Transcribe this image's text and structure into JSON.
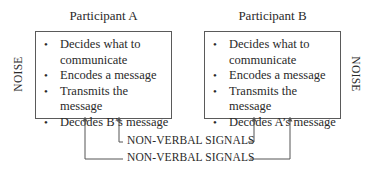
{
  "diagram": {
    "participant_a": {
      "title": "Participant A",
      "items": [
        {
          "line1": "Decides what to",
          "line2": "communicate"
        },
        {
          "line1": "Encodes a message"
        },
        {
          "line1": "Transmits the message"
        },
        {
          "line1": "Decodes B’s message"
        }
      ]
    },
    "participant_b": {
      "title": "Participant B",
      "items": [
        {
          "line1": "Decides what to",
          "line2": "communicate"
        },
        {
          "line1": "Encodes a message"
        },
        {
          "line1": "Transmits the message"
        },
        {
          "line1": "Decodes A’s message"
        }
      ]
    },
    "noise_left": "NOISE",
    "noise_right": "NOISE",
    "bullet": "•",
    "signals": {
      "inner": "NON-VERBAL SIGNALS",
      "outer": "NON-VERBAL SIGNALS"
    },
    "colors": {
      "line": "#555555",
      "text": "#2a2a2a"
    }
  }
}
